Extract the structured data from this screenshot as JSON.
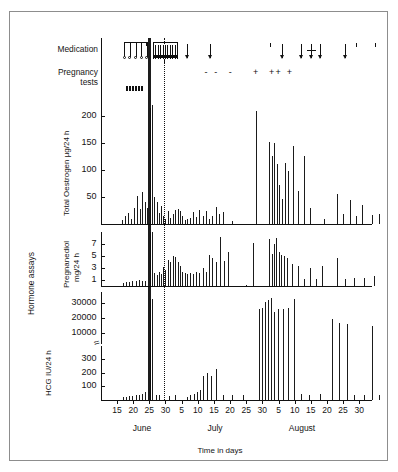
{
  "figure": {
    "faint_header": "",
    "group_label": "Hormone assays",
    "xaxis_title": "Time in days"
  },
  "rows": {
    "medication_label": "Medication",
    "pregnancy_label_line1": "Pregnancy",
    "pregnancy_label_line2": "tests",
    "menses_label": "Menses"
  },
  "panels": {
    "oestrogen": {
      "ylabel": "Total Oestrogen µg/24 h",
      "yticks": [
        "200",
        "150",
        "100",
        "50"
      ]
    },
    "pregnanediol": {
      "ylabel_line1": "Pregnanediol",
      "ylabel_line2": "mg/24 h",
      "yticks": [
        "7",
        "5",
        "3",
        "1"
      ]
    },
    "hcg": {
      "ylabel": "HCG IU/24 h",
      "yticks_upper": [
        "30000",
        "20000",
        "10000"
      ],
      "yticks_lower": [
        "300",
        "200",
        "100"
      ],
      "break_symbol": "≈"
    }
  },
  "xaxis": {
    "ticklabels": [
      "15",
      "20",
      "25",
      "30",
      "5",
      "10",
      "15",
      "20",
      "25",
      "30",
      "5",
      "10",
      "15",
      "20",
      "25",
      "30"
    ],
    "months": [
      "June",
      "July",
      "August"
    ]
  },
  "chart_data": {
    "type": "bar",
    "title": "",
    "xlabel": "Time in days",
    "x_tick_days": [
      "15",
      "20",
      "25",
      "30",
      "5",
      "10",
      "15",
      "20",
      "25",
      "30",
      "5",
      "10",
      "15",
      "20",
      "25",
      "30"
    ],
    "x_months": [
      "June",
      "July",
      "August"
    ],
    "reference_lines": [
      {
        "name": "treatment-start-solid-band",
        "x_day_index": 2.0,
        "style": "solid-black-band"
      },
      {
        "name": "reference-dotted",
        "x_day_index": 2.9,
        "style": "dotted"
      }
    ],
    "annotations": {
      "menses": [
        {
          "x": 0.55,
          "width": 1.05
        }
      ],
      "medication_brackets": [
        {
          "x": 0.45,
          "width": 1.4,
          "type": "bracket-with-circles",
          "circles": 4
        },
        {
          "x": 2.25,
          "width": 1.5,
          "type": "hatched-bracket"
        }
      ],
      "medication_arrows": [
        {
          "x": 4.35,
          "size": "large"
        },
        {
          "x": 5.75,
          "size": "large"
        },
        {
          "x": 9.5,
          "size": "small"
        },
        {
          "x": 10.2,
          "size": "large"
        },
        {
          "x": 11.4,
          "size": "large"
        },
        {
          "x": 12.0,
          "size": "cross"
        },
        {
          "x": 12.6,
          "size": "large"
        },
        {
          "x": 14.1,
          "size": "large"
        },
        {
          "x": 14.8,
          "size": "small"
        },
        {
          "x": 16.0,
          "size": "small"
        }
      ],
      "pregnancy_tests": [
        {
          "x": 5.6,
          "result": "-"
        },
        {
          "x": 6.2,
          "result": "-"
        },
        {
          "x": 7.1,
          "result": "-"
        },
        {
          "x": 8.6,
          "result": "+"
        },
        {
          "x": 9.6,
          "result": "+"
        },
        {
          "x": 10.0,
          "result": "+"
        },
        {
          "x": 10.7,
          "result": "+"
        },
        {
          "x": 18.2,
          "result": "-"
        }
      ]
    },
    "series": [
      {
        "name": "Total Oestrogen",
        "unit": "µg/24 h",
        "ylim": [
          0,
          230
        ],
        "yticks": [
          50,
          100,
          150,
          200
        ],
        "points": [
          {
            "x": 0.3,
            "y": 8
          },
          {
            "x": 0.52,
            "y": 14
          },
          {
            "x": 0.7,
            "y": 20
          },
          {
            "x": 0.88,
            "y": 10
          },
          {
            "x": 1.05,
            "y": 30
          },
          {
            "x": 1.22,
            "y": 52
          },
          {
            "x": 1.4,
            "y": 28
          },
          {
            "x": 1.55,
            "y": 60
          },
          {
            "x": 1.72,
            "y": 40
          },
          {
            "x": 1.88,
            "y": 30
          },
          {
            "x": 2.05,
            "y": 215
          },
          {
            "x": 2.18,
            "y": 220
          },
          {
            "x": 2.3,
            "y": 50
          },
          {
            "x": 2.45,
            "y": 40
          },
          {
            "x": 2.58,
            "y": 20
          },
          {
            "x": 2.72,
            "y": 34
          },
          {
            "x": 2.86,
            "y": 15
          },
          {
            "x": 3.0,
            "y": 10
          },
          {
            "x": 3.15,
            "y": 25
          },
          {
            "x": 3.3,
            "y": 12
          },
          {
            "x": 3.45,
            "y": 18
          },
          {
            "x": 3.6,
            "y": 26
          },
          {
            "x": 3.75,
            "y": 27
          },
          {
            "x": 3.9,
            "y": 25
          },
          {
            "x": 4.05,
            "y": 14
          },
          {
            "x": 4.2,
            "y": 8
          },
          {
            "x": 4.35,
            "y": 10
          },
          {
            "x": 4.5,
            "y": 12
          },
          {
            "x": 4.7,
            "y": 22
          },
          {
            "x": 4.9,
            "y": 13
          },
          {
            "x": 5.1,
            "y": 26
          },
          {
            "x": 5.3,
            "y": 14
          },
          {
            "x": 5.5,
            "y": 24
          },
          {
            "x": 5.7,
            "y": 10
          },
          {
            "x": 5.9,
            "y": 14
          },
          {
            "x": 6.1,
            "y": 32
          },
          {
            "x": 6.3,
            "y": 18
          },
          {
            "x": 6.55,
            "y": 22
          },
          {
            "x": 7.1,
            "y": 6
          },
          {
            "x": 8.6,
            "y": 210
          },
          {
            "x": 9.4,
            "y": 152
          },
          {
            "x": 9.58,
            "y": 126
          },
          {
            "x": 9.75,
            "y": 150
          },
          {
            "x": 9.92,
            "y": 112
          },
          {
            "x": 10.05,
            "y": 72
          },
          {
            "x": 10.2,
            "y": 46
          },
          {
            "x": 10.4,
            "y": 114
          },
          {
            "x": 10.58,
            "y": 98
          },
          {
            "x": 10.9,
            "y": 144
          },
          {
            "x": 11.2,
            "y": 62
          },
          {
            "x": 11.55,
            "y": 126
          },
          {
            "x": 11.95,
            "y": 30
          },
          {
            "x": 12.8,
            "y": 10
          },
          {
            "x": 13.6,
            "y": 56
          },
          {
            "x": 14.0,
            "y": 18
          },
          {
            "x": 14.4,
            "y": 44
          },
          {
            "x": 14.8,
            "y": 14
          },
          {
            "x": 15.2,
            "y": 36
          },
          {
            "x": 15.8,
            "y": 16
          },
          {
            "x": 16.2,
            "y": 18
          }
        ]
      },
      {
        "name": "Pregnanediol",
        "unit": "mg/24 h",
        "ylim": [
          0,
          9
        ],
        "yticks": [
          1,
          3,
          5,
          7
        ],
        "points": [
          {
            "x": 0.35,
            "y": 0.5
          },
          {
            "x": 0.55,
            "y": 0.6
          },
          {
            "x": 0.75,
            "y": 0.7
          },
          {
            "x": 0.95,
            "y": 0.8
          },
          {
            "x": 1.15,
            "y": 0.9
          },
          {
            "x": 1.35,
            "y": 1.0
          },
          {
            "x": 1.55,
            "y": 0.8
          },
          {
            "x": 1.75,
            "y": 0.9
          },
          {
            "x": 2.05,
            "y": 9.0
          },
          {
            "x": 2.18,
            "y": 9.0
          },
          {
            "x": 2.32,
            "y": 2.2
          },
          {
            "x": 2.45,
            "y": 1.8
          },
          {
            "x": 2.58,
            "y": 2.4
          },
          {
            "x": 2.72,
            "y": 2.0
          },
          {
            "x": 2.86,
            "y": 3.2
          },
          {
            "x": 3.0,
            "y": 2.6
          },
          {
            "x": 3.15,
            "y": 4.4
          },
          {
            "x": 3.3,
            "y": 4.0
          },
          {
            "x": 3.45,
            "y": 5.0
          },
          {
            "x": 3.6,
            "y": 4.8
          },
          {
            "x": 3.75,
            "y": 4.0
          },
          {
            "x": 3.9,
            "y": 3.4
          },
          {
            "x": 4.05,
            "y": 2.4
          },
          {
            "x": 4.2,
            "y": 2.2
          },
          {
            "x": 4.35,
            "y": 2.0
          },
          {
            "x": 4.5,
            "y": 2.2
          },
          {
            "x": 4.7,
            "y": 2.0
          },
          {
            "x": 4.9,
            "y": 2.4
          },
          {
            "x": 5.1,
            "y": 2.2
          },
          {
            "x": 5.3,
            "y": 3.0
          },
          {
            "x": 5.5,
            "y": 2.4
          },
          {
            "x": 5.7,
            "y": 5.2
          },
          {
            "x": 5.9,
            "y": 4.6
          },
          {
            "x": 6.1,
            "y": 4.0
          },
          {
            "x": 6.35,
            "y": 8.2
          },
          {
            "x": 6.6,
            "y": 4.2
          },
          {
            "x": 6.9,
            "y": 5.6
          },
          {
            "x": 8.0,
            "y": 0.2
          },
          {
            "x": 8.4,
            "y": 7.2
          },
          {
            "x": 9.4,
            "y": 7.8
          },
          {
            "x": 9.58,
            "y": 5.4
          },
          {
            "x": 9.72,
            "y": 7.0
          },
          {
            "x": 9.86,
            "y": 8.0
          },
          {
            "x": 10.0,
            "y": 5.6
          },
          {
            "x": 10.15,
            "y": 5.2
          },
          {
            "x": 10.35,
            "y": 5.0
          },
          {
            "x": 10.55,
            "y": 4.6
          },
          {
            "x": 10.85,
            "y": 3.6
          },
          {
            "x": 11.2,
            "y": 3.4
          },
          {
            "x": 11.55,
            "y": 1.2
          },
          {
            "x": 11.95,
            "y": 3.0
          },
          {
            "x": 12.3,
            "y": 1.2
          },
          {
            "x": 12.7,
            "y": 3.4
          },
          {
            "x": 13.6,
            "y": 4.6
          },
          {
            "x": 14.1,
            "y": 1.2
          },
          {
            "x": 14.7,
            "y": 1.4
          },
          {
            "x": 15.3,
            "y": 1.4
          },
          {
            "x": 15.9,
            "y": 1.6
          }
        ]
      },
      {
        "name": "HCG",
        "unit": "IU/24 h",
        "axis_broken": true,
        "lower_range": [
          0,
          350
        ],
        "upper_range": [
          5000,
          35000
        ],
        "yticks_lower": [
          100,
          200,
          300
        ],
        "yticks_upper": [
          10000,
          20000,
          30000
        ],
        "points": [
          {
            "x": 0.35,
            "y": 20
          },
          {
            "x": 0.55,
            "y": 25
          },
          {
            "x": 0.75,
            "y": 30
          },
          {
            "x": 0.95,
            "y": 28
          },
          {
            "x": 1.15,
            "y": 34
          },
          {
            "x": 1.35,
            "y": 40
          },
          {
            "x": 1.55,
            "y": 45
          },
          {
            "x": 1.75,
            "y": 55
          },
          {
            "x": 2.05,
            "y": 33000
          },
          {
            "x": 2.18,
            "y": 33000
          },
          {
            "x": 2.4,
            "y": 40
          },
          {
            "x": 2.6,
            "y": 35
          },
          {
            "x": 3.2,
            "y": 30
          },
          {
            "x": 3.6,
            "y": 35
          },
          {
            "x": 4.35,
            "y": 25
          },
          {
            "x": 4.55,
            "y": 35
          },
          {
            "x": 4.75,
            "y": 45
          },
          {
            "x": 4.95,
            "y": 60
          },
          {
            "x": 5.15,
            "y": 75
          },
          {
            "x": 5.35,
            "y": 175
          },
          {
            "x": 5.6,
            "y": 195
          },
          {
            "x": 5.85,
            "y": 175
          },
          {
            "x": 6.15,
            "y": 225
          },
          {
            "x": 6.55,
            "y": 40
          },
          {
            "x": 7.1,
            "y": 35
          },
          {
            "x": 7.8,
            "y": 35
          },
          {
            "x": 8.8,
            "y": 26000
          },
          {
            "x": 8.95,
            "y": 27000
          },
          {
            "x": 9.15,
            "y": 31000
          },
          {
            "x": 9.35,
            "y": 32000
          },
          {
            "x": 9.55,
            "y": 33500
          },
          {
            "x": 9.75,
            "y": 24000
          },
          {
            "x": 9.95,
            "y": 26000
          },
          {
            "x": 10.25,
            "y": 26000
          },
          {
            "x": 10.6,
            "y": 27000
          },
          {
            "x": 10.95,
            "y": 33000
          },
          {
            "x": 11.4,
            "y": 45
          },
          {
            "x": 11.9,
            "y": 40
          },
          {
            "x": 12.6,
            "y": 45
          },
          {
            "x": 13.3,
            "y": 19000
          },
          {
            "x": 13.75,
            "y": 16500
          },
          {
            "x": 14.25,
            "y": 16000
          },
          {
            "x": 14.7,
            "y": 40
          },
          {
            "x": 15.3,
            "y": 40
          },
          {
            "x": 15.8,
            "y": 14500
          },
          {
            "x": 16.25,
            "y": 35
          }
        ]
      }
    ]
  }
}
